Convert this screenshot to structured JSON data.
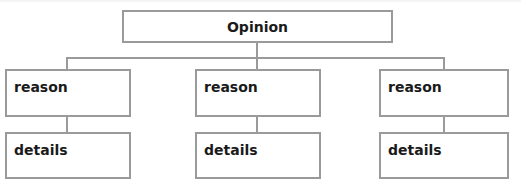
{
  "diagram": {
    "type": "tree",
    "root": {
      "label": "Opinion"
    },
    "columns": [
      {
        "reason": "reason",
        "details": "details"
      },
      {
        "reason": "reason",
        "details": "details"
      },
      {
        "reason": "reason",
        "details": "details"
      }
    ],
    "colors": {
      "border": "#9a9a9a",
      "text": "#1a1a1a",
      "background": "#ffffff"
    }
  }
}
